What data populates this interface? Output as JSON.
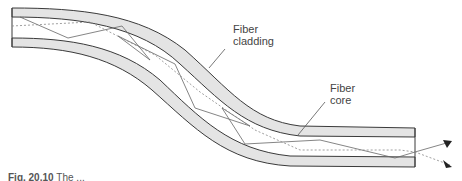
{
  "figure": {
    "labels": {
      "cladding_line1": "Fiber",
      "cladding_line2": "cladding",
      "core_line1": "Fiber",
      "core_line2": "core"
    },
    "caption": {
      "number": "Fig. 20.10",
      "text_fragment": "The ..."
    },
    "colors": {
      "cladding_fill": "#e4e4e4",
      "outline": "#3a3a3a",
      "ray": "#666666",
      "dotted_ray": "#888888",
      "label_text": "#444444"
    }
  }
}
